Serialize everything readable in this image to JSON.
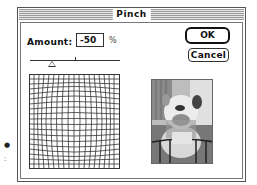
{
  "dialog": {
    "title": "Pinch"
  },
  "amount": {
    "label": "Amount:",
    "value": "-50",
    "unit": "%"
  },
  "slider": {
    "min": -100,
    "max": 100,
    "value": -50
  },
  "buttons": {
    "ok_label": "OK",
    "cancel_label": "Cancel"
  },
  "previews": {
    "grid_icon": "pinch-distortion-grid",
    "image_icon": "bulldog-photo-preview"
  },
  "colors": {
    "frame": "#555555",
    "text": "#111111",
    "background": "#ffffff"
  }
}
